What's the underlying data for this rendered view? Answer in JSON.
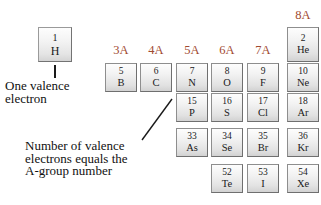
{
  "figure": {
    "background": "#ffffff",
    "header_color": "#9f4a30",
    "box_border_color": "#8e8e8e",
    "text_color": "#111111"
  },
  "group_headers": [
    {
      "label": "3A",
      "x": 105
    },
    {
      "label": "4A",
      "x": 140
    },
    {
      "label": "5A",
      "x": 176
    },
    {
      "label": "6A",
      "x": 211
    },
    {
      "label": "7A",
      "x": 247
    },
    {
      "label": "8A",
      "x": 287
    }
  ],
  "hydrogen": {
    "number": "1",
    "symbol": "H"
  },
  "helium": {
    "number": "2",
    "symbol": "He"
  },
  "rows": [
    {
      "row_index": 2,
      "y": 63,
      "cells": [
        {
          "number": "5",
          "symbol": "B",
          "x": 105
        },
        {
          "number": "6",
          "symbol": "C",
          "x": 140
        },
        {
          "number": "7",
          "symbol": "N",
          "x": 176
        },
        {
          "number": "8",
          "symbol": "O",
          "x": 211
        },
        {
          "number": "9",
          "symbol": "F",
          "x": 247
        },
        {
          "number": "10",
          "symbol": "Ne",
          "x": 287
        }
      ]
    },
    {
      "row_index": 3,
      "y": 93,
      "cells": [
        {
          "number": "15",
          "symbol": "P",
          "x": 176
        },
        {
          "number": "16",
          "symbol": "S",
          "x": 211
        },
        {
          "number": "17",
          "symbol": "Cl",
          "x": 247
        },
        {
          "number": "18",
          "symbol": "Ar",
          "x": 287
        }
      ]
    },
    {
      "row_index": 4,
      "y": 128,
      "cells": [
        {
          "number": "33",
          "symbol": "As",
          "x": 176
        },
        {
          "number": "34",
          "symbol": "Se",
          "x": 211
        },
        {
          "number": "35",
          "symbol": "Br",
          "x": 247
        },
        {
          "number": "36",
          "symbol": "Kr",
          "x": 287
        }
      ]
    },
    {
      "row_index": 5,
      "y": 164,
      "cells": [
        {
          "number": "52",
          "symbol": "Te",
          "x": 211
        },
        {
          "number": "53",
          "symbol": "I",
          "x": 247
        },
        {
          "number": "54",
          "symbol": "Xe",
          "x": 287
        }
      ]
    }
  ],
  "annotations": {
    "valence_note": {
      "line1": "One valence",
      "line2": "electron"
    },
    "agroup_note": {
      "line1": "Number of valence",
      "line2": "electrons equals the",
      "line3": "A-group number"
    }
  }
}
